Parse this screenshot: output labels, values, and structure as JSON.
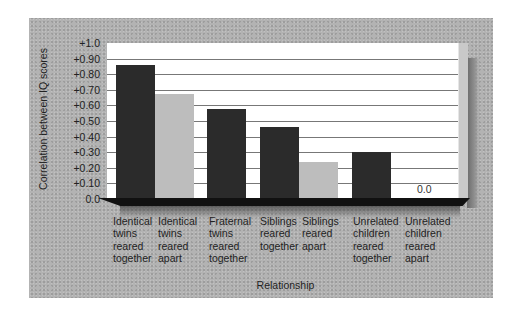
{
  "chart_data": {
    "type": "bar",
    "title": "",
    "xlabel": "Relationship",
    "ylabel": "Correlation between IQ scores",
    "ylim": [
      0.0,
      1.0
    ],
    "yticks": [
      "+1.0",
      "+0.90",
      "+0.80",
      "+0.70",
      "+0.60",
      "+0.50",
      "+0.40",
      "+0.30",
      "+0.20",
      "+0.10",
      "0.0"
    ],
    "grid": true,
    "categories": [
      "Identical twins reared together",
      "Identical twins reared apart",
      "Fraternal twins reared together",
      "Siblings reared together",
      "Siblings reared apart",
      "Unrelated children reared together",
      "Unrelated children reared apart"
    ],
    "category_lines": [
      [
        "Identical",
        "twins",
        "reared",
        "together"
      ],
      [
        "Identical",
        "twins",
        "reared",
        "apart"
      ],
      [
        "Fraternal",
        "twins",
        "reared",
        "together"
      ],
      [
        "Siblings",
        "reared",
        "together"
      ],
      [
        "Siblings",
        "reared",
        "apart"
      ],
      [
        "Unrelated",
        "children",
        "reared",
        "together"
      ],
      [
        "Unrelated",
        "children",
        "reared",
        "apart"
      ]
    ],
    "values": [
      0.86,
      0.67,
      0.58,
      0.46,
      0.24,
      0.3,
      0.0
    ],
    "bar_shades": [
      "dark",
      "light",
      "dark",
      "dark",
      "light",
      "dark",
      "none"
    ],
    "annotations": [
      {
        "category": "Unrelated children reared apart",
        "text": "0.0"
      }
    ],
    "colors": {
      "reared_together": "#2b2b2b",
      "reared_apart": "#bdbdbd",
      "background": "#b3b3b3",
      "plot": "#ffffff"
    }
  }
}
